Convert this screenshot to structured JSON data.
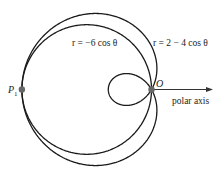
{
  "figure": {
    "type": "polar-curves",
    "origin_px": [
      151.5,
      89.5
    ],
    "scale_px_per_unit": 21.6,
    "colors": {
      "curve": "#1a1a1a",
      "point": "#666666",
      "axis": "#333333",
      "text": "#222222"
    },
    "curves": [
      {
        "name": "circle",
        "label": "r = −6 cos θ",
        "a": 0,
        "b": -6,
        "label_pos": [
          72,
          46
        ]
      },
      {
        "name": "limacon",
        "label": "r = 2 − 4 cos θ",
        "a": 2,
        "b": -4,
        "label_pos": [
          153,
          46
        ]
      }
    ],
    "points": [
      {
        "name": "P1",
        "label": "P",
        "subscript": "1",
        "polar": [
          6,
          3.14159265
        ],
        "label_pos": [
          8,
          93
        ]
      },
      {
        "name": "O",
        "label": "O",
        "polar": [
          0,
          0
        ],
        "label_pos": [
          156,
          87
        ]
      }
    ],
    "polar_axis": {
      "label": "polar axis",
      "end_px": [
        213,
        89.5
      ],
      "label_pos": [
        172,
        104
      ]
    }
  }
}
